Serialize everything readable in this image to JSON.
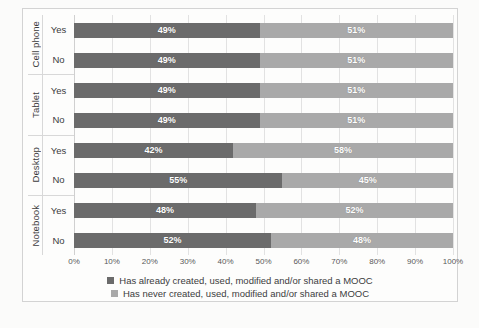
{
  "chart_data": {
    "type": "bar",
    "orientation": "horizontal",
    "stacked": true,
    "title": "",
    "xlabel": "",
    "ylabel": "",
    "xlim": [
      0,
      100
    ],
    "grid": true,
    "legend_position": "bottom",
    "categories": [
      "Cell phone - Yes",
      "Cell phone - No",
      "Tablet - Yes",
      "Tablet - No",
      "Desktop - Yes",
      "Desktop - No",
      "Notebook - Yes",
      "Notebook - No"
    ],
    "groups": [
      {
        "name": "Cell phone",
        "rows": [
          "Yes",
          "No"
        ]
      },
      {
        "name": "Tablet",
        "rows": [
          "Yes",
          "No"
        ]
      },
      {
        "name": "Desktop",
        "rows": [
          "Yes",
          "No"
        ]
      },
      {
        "name": "Notebook",
        "rows": [
          "Yes",
          "No"
        ]
      }
    ],
    "series": [
      {
        "name": "Has already created, used, modified and/or shared a MOOC",
        "color": "#6b6b6b",
        "values": [
          49,
          49,
          49,
          49,
          42,
          55,
          48,
          52
        ],
        "labels": [
          "49%",
          "49%",
          "49%",
          "49%",
          "42%",
          "55%",
          "48%",
          "52%"
        ]
      },
      {
        "name": "Has never created, used, modified and/or shared a MOOC",
        "color": "#a9a9a9",
        "values": [
          51,
          51,
          51,
          51,
          58,
          45,
          52,
          48
        ],
        "labels": [
          "51%",
          "51%",
          "51%",
          "51%",
          "58%",
          "45%",
          "52%",
          "48%"
        ]
      }
    ],
    "xticks": [
      "0%",
      "10%",
      "20%",
      "30%",
      "40%",
      "50%",
      "60%",
      "70%",
      "80%",
      "90%",
      "100%"
    ],
    "xtick_values": [
      0,
      10,
      20,
      30,
      40,
      50,
      60,
      70,
      80,
      90,
      100
    ]
  },
  "legend": {
    "items": [
      {
        "label": "Has already created, used, modified and/or shared a MOOC"
      },
      {
        "label": "Has never created, used, modified and/or shared a MOOC"
      }
    ]
  },
  "caption": ""
}
